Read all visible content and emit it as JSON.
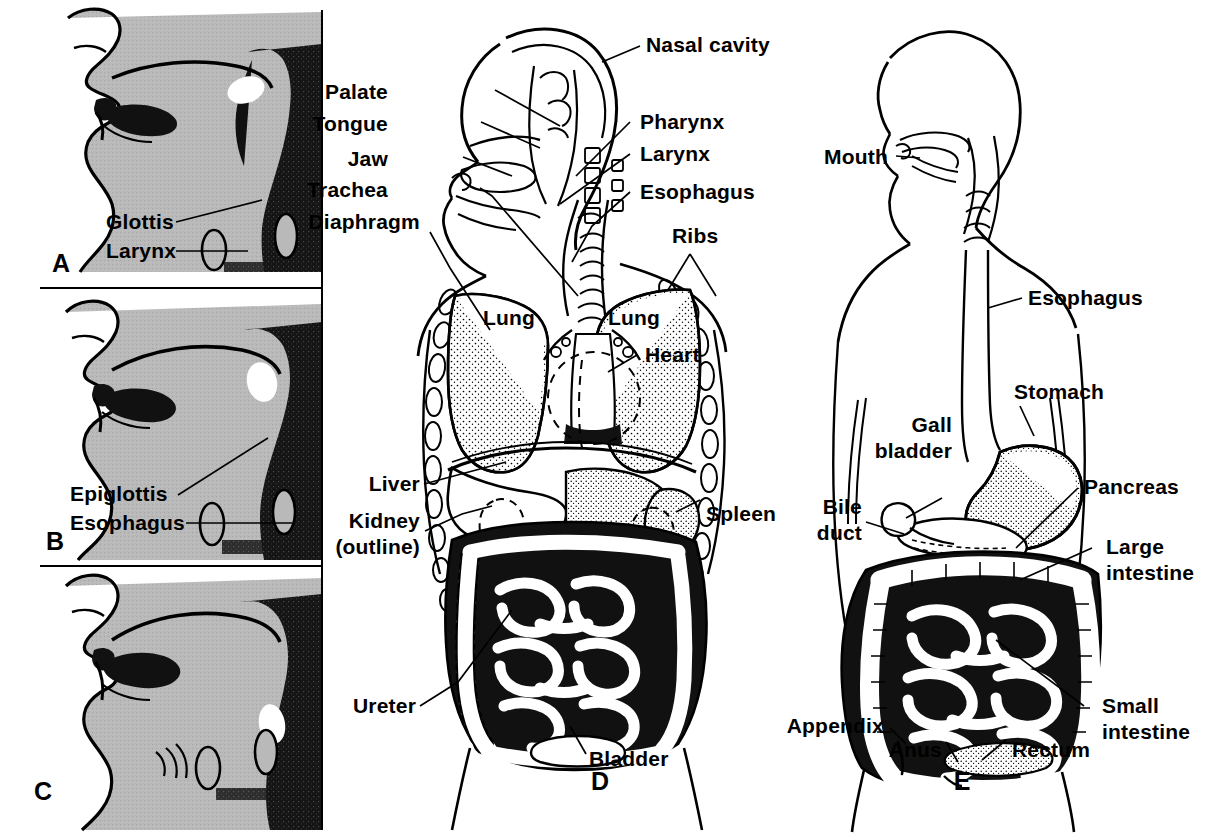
{
  "figure": {
    "panel_letters": [
      "A",
      "B",
      "C",
      "D",
      "E"
    ],
    "colors": {
      "background": "#ffffff",
      "ink": "#000000",
      "tissue_gray": "#b9b9b9",
      "tissue_gray_dark": "#a8a8a8",
      "cavity_black": "#111111",
      "opening_white": "#ffffff"
    }
  },
  "panels": {
    "a": {
      "letter": "A",
      "caption_note": "Sagittal head section, tongue at rest",
      "labels": [
        {
          "text": "Glottis",
          "name": "glottis"
        },
        {
          "text": "Larynx",
          "name": "larynx"
        }
      ]
    },
    "b": {
      "letter": "B",
      "caption_note": "Sagittal head section, swallowing",
      "labels": [
        {
          "text": "Epiglottis",
          "name": "epiglottis"
        },
        {
          "text": "Esophagus",
          "name": "esophagus"
        }
      ]
    },
    "c": {
      "letter": "C",
      "caption_note": "Sagittal head section, speaking",
      "labels": []
    },
    "d": {
      "letter": "D",
      "caption_note": "Frontal view of thorax and abdomen",
      "labels_left": [
        {
          "text": "Palate",
          "name": "palate"
        },
        {
          "text": "Tongue",
          "name": "tongue"
        },
        {
          "text": "Jaw",
          "name": "jaw"
        },
        {
          "text": "Trachea",
          "name": "trachea"
        },
        {
          "text": "Diaphragm",
          "name": "diaphragm"
        },
        {
          "text": "Liver",
          "name": "liver"
        },
        {
          "text": "Kidney",
          "name": "kidney"
        },
        {
          "text": "(outline)",
          "name": "kidney-outline-note"
        },
        {
          "text": "Ureter",
          "name": "ureter"
        }
      ],
      "labels_right": [
        {
          "text": "Nasal cavity",
          "name": "nasal-cavity"
        },
        {
          "text": "Pharynx",
          "name": "pharynx"
        },
        {
          "text": "Larynx",
          "name": "larynx"
        },
        {
          "text": "Esophagus",
          "name": "esophagus"
        },
        {
          "text": "Ribs",
          "name": "ribs"
        },
        {
          "text": "Spleen",
          "name": "spleen"
        }
      ],
      "labels_inner": [
        {
          "text": "Lung",
          "name": "lung-left"
        },
        {
          "text": "Lung",
          "name": "lung-right"
        },
        {
          "text": "Heart",
          "name": "heart"
        },
        {
          "text": "Bladder",
          "name": "bladder"
        }
      ]
    },
    "e": {
      "letter": "E",
      "caption_note": "Digestive tract overview",
      "labels_left": [
        {
          "text": "Mouth",
          "name": "mouth"
        },
        {
          "text": "Gall",
          "name": "gall-1"
        },
        {
          "text": "bladder",
          "name": "gall-2"
        },
        {
          "text": "Bile",
          "name": "bile-1"
        },
        {
          "text": "duct",
          "name": "bile-2"
        },
        {
          "text": "Appendix",
          "name": "appendix"
        },
        {
          "text": "Anus",
          "name": "anus"
        }
      ],
      "labels_right": [
        {
          "text": "Esophagus",
          "name": "esophagus"
        },
        {
          "text": "Stomach",
          "name": "stomach"
        },
        {
          "text": "Pancreas",
          "name": "pancreas"
        },
        {
          "text": "Large",
          "name": "large-1"
        },
        {
          "text": "intestine",
          "name": "large-2"
        },
        {
          "text": "Small",
          "name": "small-1"
        },
        {
          "text": "intestine",
          "name": "small-2"
        },
        {
          "text": "Rectum",
          "name": "rectum"
        }
      ]
    }
  }
}
